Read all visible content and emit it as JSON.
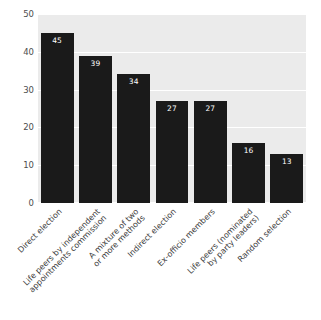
{
  "chart_data": {
    "type": "bar",
    "title": "",
    "subtitle": "",
    "xlabel": "",
    "ylabel": "",
    "ylim": [
      0,
      50
    ],
    "yticks": [
      0,
      10,
      20,
      30,
      40,
      50
    ],
    "ytick_labels": [
      "0",
      "10",
      "20",
      "30",
      "40",
      "50"
    ],
    "grid": true,
    "legend": false,
    "legend_position": "none",
    "bar_color": "#1a1a1a",
    "plot_background": "#ebebeb",
    "gridline_color": "#ffffff",
    "value_label_color": "#ffffff",
    "categories": [
      "Direct election",
      "Life peers by independent appointments commission",
      "A mixture of two or more methods",
      "Indirect election",
      "Ex-officio members",
      "Life peers (nominated by party leaders)",
      "Random selection"
    ],
    "category_lines": [
      [
        "Direct election"
      ],
      [
        "Life peers by independent",
        "appointments commission"
      ],
      [
        "A mixture of two",
        "or more methods"
      ],
      [
        "Indirect election"
      ],
      [
        "Ex-officio members"
      ],
      [
        "Life peers (nominated",
        "by party leaders)"
      ],
      [
        "Random selection"
      ]
    ],
    "values": [
      45,
      39,
      34,
      27,
      27,
      16,
      13
    ],
    "value_labels": [
      "45",
      "39",
      "34",
      "27",
      "27",
      "16",
      "13"
    ]
  }
}
